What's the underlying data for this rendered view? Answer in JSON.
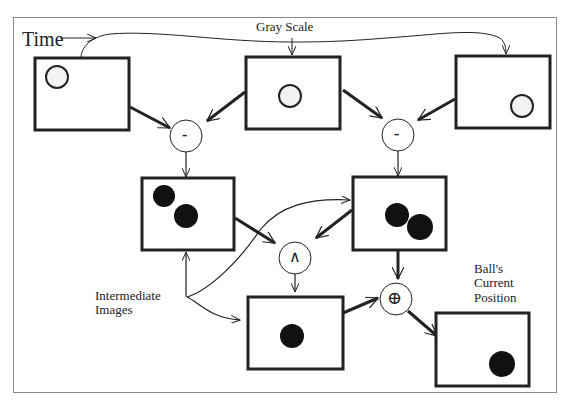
{
  "labels": {
    "time": "Time",
    "gray_scale": "Gray Scale",
    "intermediate_line1": "Intermediate",
    "intermediate_line2": "Images",
    "ball_line1": "Ball's",
    "ball_line2": "Current",
    "ball_line3": "Position"
  },
  "operators": {
    "subtract_left": "-",
    "subtract_right": "-",
    "and": "∧",
    "xor": "⊕"
  },
  "frames": [
    {
      "name": "frame-t1",
      "content": "hollow circle top-left"
    },
    {
      "name": "frame-t2",
      "content": "hollow circle center"
    },
    {
      "name": "frame-t3",
      "content": "hollow circle bottom-right"
    },
    {
      "name": "diff-1",
      "content": "two filled circles"
    },
    {
      "name": "diff-2",
      "content": "two filled circles"
    },
    {
      "name": "and-result",
      "content": "one filled circle"
    },
    {
      "name": "current-position",
      "content": "one filled circle"
    }
  ],
  "colors": {
    "line": "#222222",
    "fill": "#111111",
    "frame": "#888888"
  }
}
